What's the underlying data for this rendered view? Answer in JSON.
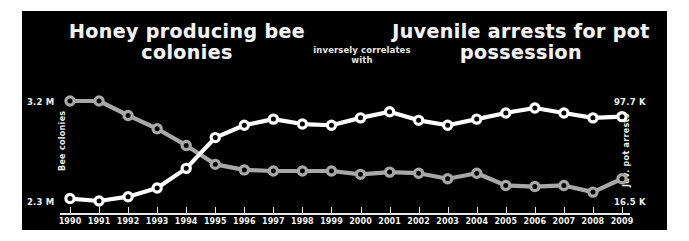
{
  "chart_data": {
    "type": "line",
    "title": "Honey producing bee colonies inversely correlates with Juvenile arrests for pot possession",
    "title_left": "Honey producing bee colonies",
    "title_right": "Juvenile arrests for pot possession",
    "subtitle": "inversely correlates with",
    "xlabel": "",
    "grid": false,
    "legend_position": "none",
    "x": [
      1990,
      1991,
      1992,
      1993,
      1994,
      1995,
      1996,
      1997,
      1998,
      1999,
      2000,
      2001,
      2002,
      2003,
      2004,
      2005,
      2006,
      2007,
      2008,
      2009
    ],
    "categories": [
      "1990",
      "1991",
      "1992",
      "1993",
      "1994",
      "1995",
      "1996",
      "1997",
      "1998",
      "1999",
      "2000",
      "2001",
      "2002",
      "2003",
      "2004",
      "2005",
      "2006",
      "2007",
      "2008",
      "2009"
    ],
    "axes": [
      {
        "name": "Bee colonies",
        "side": "left",
        "tick_labels": [
          "3.2 M",
          "2.3 M"
        ],
        "ylim": [
          2.3,
          3.2
        ],
        "units": "M"
      },
      {
        "name": "Juv. pot arrests",
        "side": "right",
        "tick_labels": [
          "97.7 K",
          "16.5 K"
        ],
        "ylim": [
          16.5,
          97.7
        ],
        "units": "K"
      }
    ],
    "series": [
      {
        "name": "Honey producing bee colonies",
        "axis": "left",
        "color": "#a8a8a8",
        "units": "M",
        "values": [
          3.2,
          3.2,
          3.07,
          2.95,
          2.8,
          2.63,
          2.58,
          2.57,
          2.57,
          2.57,
          2.54,
          2.56,
          2.55,
          2.5,
          2.55,
          2.44,
          2.43,
          2.44,
          2.38,
          2.5
        ]
      },
      {
        "name": "Juvenile arrests for pot possession",
        "axis": "right",
        "color": "#ffffff",
        "units": "K",
        "values": [
          18.5,
          16.5,
          20.0,
          27.0,
          43.0,
          68.0,
          78.0,
          83.0,
          79.0,
          78.0,
          84.0,
          89.0,
          82.0,
          78.0,
          83.0,
          88.0,
          92.0,
          88.0,
          84.0,
          85.0
        ]
      }
    ]
  },
  "colors": {
    "background": "#000000",
    "page": "#ffffff",
    "text": "#f2f2f2",
    "series_bees": "#a8a8a8",
    "series_arrests": "#ffffff",
    "axis": "#e8e8e8"
  }
}
